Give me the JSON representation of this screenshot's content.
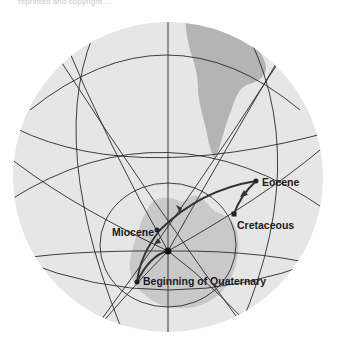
{
  "caption": "reprinted and copyright ...",
  "figure": {
    "colors": {
      "ocean": "#e6e6e6",
      "land_antarctica": "#c9c9c9",
      "land_south_america": "#b4b4b4",
      "grid": "#2a2a2a",
      "path": "#333333"
    },
    "points": [
      {
        "name": "Eocene",
        "label": "Eocene"
      },
      {
        "name": "Cretaceous",
        "label": "Cretaceous"
      },
      {
        "name": "Miocene",
        "label": "Miocene"
      },
      {
        "name": "Beginning of Quaternary",
        "label": "Beginning of Quaternary"
      }
    ]
  }
}
